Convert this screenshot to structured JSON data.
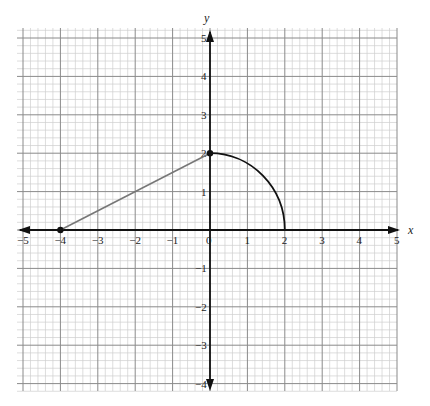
{
  "chart_data": {
    "type": "line",
    "title": "",
    "xlabel": "x",
    "ylabel": "y",
    "xlim": [
      -5,
      5
    ],
    "ylim": [
      -4,
      5
    ],
    "grid": {
      "major_step": 1,
      "minor_subdivisions": 5
    },
    "x_ticks": [
      "-5",
      "-4",
      "-3",
      "-2",
      "-1",
      "0",
      "1",
      "2",
      "3",
      "4",
      "5"
    ],
    "y_ticks": [
      "-4",
      "-3",
      "-2",
      "-1",
      "1",
      "2",
      "3",
      "4",
      "5"
    ],
    "series": [
      {
        "name": "segment",
        "kind": "line_segment",
        "points": [
          [
            -4,
            0
          ],
          [
            0,
            2
          ]
        ],
        "color": "#777777"
      },
      {
        "name": "quarter_circle",
        "kind": "arc",
        "center": [
          0,
          0
        ],
        "radius": 2,
        "from": [
          0,
          2
        ],
        "to": [
          2,
          0
        ],
        "color": "#111111"
      }
    ],
    "marked_points": [
      [
        -4,
        0
      ],
      [
        0,
        2
      ]
    ],
    "legend": null
  }
}
